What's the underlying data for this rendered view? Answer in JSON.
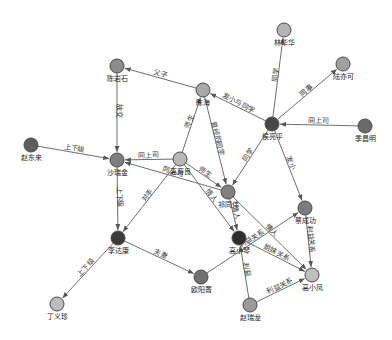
{
  "diagram": {
    "type": "relationship-graph",
    "node_colors": {
      "dark": "#3c3c3c",
      "mid": "#7e7e7e",
      "midlight": "#9a9a9a",
      "light": "#c2c2c2"
    },
    "nodes": [
      {
        "id": "ljh",
        "label": "林华华",
        "x": 284,
        "y": 30,
        "r": 7,
        "color": "#b4b4b4"
      },
      {
        "id": "lkk",
        "label": "陆亦可",
        "x": 343,
        "y": 64,
        "r": 7,
        "color": "#a0a0a0"
      },
      {
        "id": "chs",
        "label": "陈岩石",
        "x": 117,
        "y": 66,
        "r": 7,
        "color": "#8c8c8c"
      },
      {
        "id": "cy",
        "label": "陈海",
        "x": 203,
        "y": 90,
        "r": 7,
        "color": "#a8a8a8"
      },
      {
        "id": "hlp",
        "label": "侯亮平",
        "x": 272,
        "y": 124,
        "r": 7,
        "color": "#474747"
      },
      {
        "id": "jqm",
        "label": "季昌明",
        "x": 365,
        "y": 126,
        "r": 7,
        "color": "#6a6a6a"
      },
      {
        "id": "zdl",
        "label": "赵东来",
        "x": 31,
        "y": 145,
        "r": 7,
        "color": "#5e5e5e"
      },
      {
        "id": "qrj",
        "label": "沙瑞金",
        "x": 117,
        "y": 160,
        "r": 7,
        "color": "#7e7e7e"
      },
      {
        "id": "gyl",
        "label": "高育良",
        "x": 180,
        "y": 159,
        "r": 7,
        "color": "#b8b8b8"
      },
      {
        "id": "qtc",
        "label": "祁同伟",
        "x": 228,
        "y": 192,
        "r": 7,
        "color": "#808080"
      },
      {
        "id": "clg",
        "label": "蔡成功",
        "x": 305,
        "y": 208,
        "r": 7,
        "color": "#7c7c7c"
      },
      {
        "id": "lda",
        "label": "李达康",
        "x": 118,
        "y": 238,
        "r": 7,
        "color": "#3a3a3a"
      },
      {
        "id": "grs",
        "label": "高小琴",
        "x": 239,
        "y": 238,
        "r": 7,
        "color": "#2e2e2e"
      },
      {
        "id": "ozm",
        "label": "欧阳菁",
        "x": 201,
        "y": 277,
        "r": 7,
        "color": "#707070"
      },
      {
        "id": "gxf",
        "label": "高小凤",
        "x": 312,
        "y": 275,
        "r": 7,
        "color": "#bebebe"
      },
      {
        "id": "zrl",
        "label": "赵瑞龙",
        "x": 250,
        "y": 305,
        "r": 7,
        "color": "#9a9a9a"
      },
      {
        "id": "dys",
        "label": "丁义珍",
        "x": 57,
        "y": 304,
        "r": 7,
        "color": "#bcbcbc"
      }
    ],
    "edges": [
      {
        "source": "hlp",
        "target": "ljh",
        "label": "同学"
      },
      {
        "source": "hlp",
        "target": "lkk",
        "label": "同事"
      },
      {
        "source": "jqm",
        "target": "hlp",
        "label": "同上司"
      },
      {
        "source": "hlp",
        "target": "cy",
        "label": "发小与同学"
      },
      {
        "source": "hlp",
        "target": "qtc",
        "label": "同学"
      },
      {
        "source": "hlp",
        "target": "clg",
        "label": "发小"
      },
      {
        "source": "cy",
        "target": "chs",
        "label": "父子"
      },
      {
        "source": "chs",
        "target": "qrj",
        "label": "故交"
      },
      {
        "source": "zdl",
        "target": "qrj",
        "label": "上下级"
      },
      {
        "source": "gyl",
        "target": "qrj",
        "label": "同上司"
      },
      {
        "source": "gyl",
        "target": "cy",
        "label": "师生"
      },
      {
        "source": "cy",
        "target": "qtc",
        "label": "曾经的同学"
      },
      {
        "source": "gyl",
        "target": "qtc",
        "label": "师生"
      },
      {
        "source": "qtc",
        "target": "qrj",
        "label": "同上司"
      },
      {
        "source": "gyl",
        "target": "lda",
        "label": "对手"
      },
      {
        "source": "qrj",
        "target": "lda",
        "label": "上下级"
      },
      {
        "source": "gyl",
        "target": "grs",
        "label": "情人"
      },
      {
        "source": "qtc",
        "target": "grs",
        "label": "情人"
      },
      {
        "source": "lda",
        "target": "ozm",
        "label": "夫妻"
      },
      {
        "source": "lda",
        "target": "dys",
        "label": "上下级"
      },
      {
        "source": "ozm",
        "target": "clg",
        "label": "利益关系"
      },
      {
        "source": "grs",
        "target": "gxf",
        "label": "姐妹关系"
      },
      {
        "source": "qtc",
        "target": "gxf",
        "label": "情人"
      },
      {
        "source": "clg",
        "target": "gxf",
        "label": "利益关系"
      },
      {
        "source": "zrl",
        "target": "grs",
        "label": "利益"
      },
      {
        "source": "zrl",
        "target": "gxf",
        "label": "利益关系"
      }
    ]
  }
}
